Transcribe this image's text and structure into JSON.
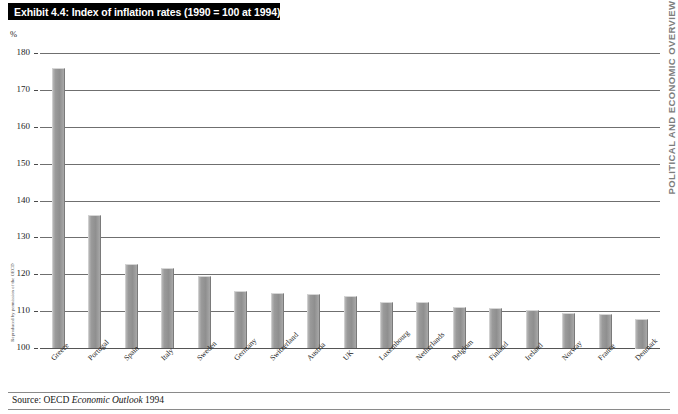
{
  "exhibit": {
    "title": "Exhibit 4.4: Index of inflation rates (1990 = 100 at 1994)",
    "source_prefix": "Source: OECD ",
    "source_italic": "Economic Outlook",
    "source_suffix": " 1994",
    "margin_left_credit": "Reproduced by permission of the OECD",
    "margin_right_header": "POLITICAL AND ECONOMIC OVERVIEW"
  },
  "chart_data": {
    "type": "bar",
    "title": "Exhibit 4.4: Index of inflation rates (1990 = 100 at 1994)",
    "xlabel": "",
    "ylabel": "%",
    "ylim": [
      100,
      180
    ],
    "yticks": [
      100,
      110,
      120,
      130,
      140,
      150,
      160,
      170,
      180
    ],
    "grid": true,
    "legend": "none",
    "bar_color": "#9a9a9a",
    "categories": [
      "Greece",
      "Portugal",
      "Spain",
      "Italy",
      "Sweden",
      "Germany",
      "Switzerland",
      "Austria",
      "UK",
      "Luxembourg",
      "Netherlands",
      "Belgium",
      "Finland",
      "Ireland",
      "Norway",
      "France",
      "Denmark"
    ],
    "values": [
      176.0,
      136.0,
      122.8,
      121.8,
      119.5,
      115.5,
      114.8,
      114.6,
      114.0,
      112.6,
      112.4,
      111.2,
      110.8,
      110.3,
      109.5,
      109.2,
      108.0
    ]
  }
}
